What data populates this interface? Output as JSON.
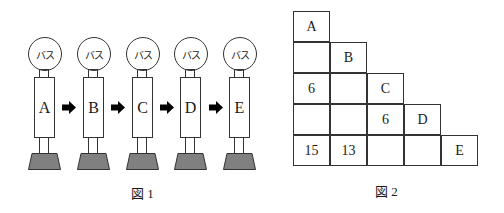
{
  "figure1": {
    "caption": "図 1",
    "units": [
      {
        "circle_label": "バス",
        "body_label": "A"
      },
      {
        "circle_label": "バス",
        "body_label": "B"
      },
      {
        "circle_label": "バス",
        "body_label": "C"
      },
      {
        "circle_label": "バス",
        "body_label": "D"
      },
      {
        "circle_label": "バス",
        "body_label": "E"
      }
    ],
    "arrow_count": 4,
    "colors": {
      "base_fill": "#808080",
      "stroke": "#333333",
      "arrow": "#000000"
    }
  },
  "figure2": {
    "caption": "図 2",
    "rows": [
      [
        "A"
      ],
      [
        "",
        "B"
      ],
      [
        "6",
        "",
        "C"
      ],
      [
        "",
        "",
        "6",
        "D"
      ],
      [
        "15",
        "13",
        "",
        "",
        "E"
      ]
    ]
  }
}
